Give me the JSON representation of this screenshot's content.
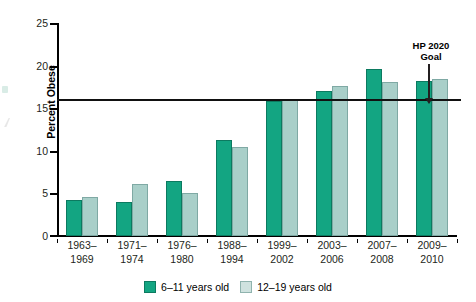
{
  "chart_data": {
    "type": "bar",
    "title": "",
    "xlabel": "",
    "ylabel": "Percent Obese",
    "ylim": [
      0,
      25
    ],
    "yticks": [
      0,
      5,
      10,
      15,
      20,
      25
    ],
    "grid": false,
    "legend_position": "bottom-center",
    "categories": [
      "1963–\n1969",
      "1971–\n1974",
      "1976–\n1980",
      "1988–\n1994",
      "1999–\n2002",
      "2003–\n2006",
      "2007–\n2008",
      "2009–\n2010"
    ],
    "category_lines": [
      [
        "1963–",
        "1969"
      ],
      [
        "1971–",
        "1974"
      ],
      [
        "1976–",
        "1980"
      ],
      [
        "1988–",
        "1994"
      ],
      [
        "1999–",
        "2002"
      ],
      [
        "2003–",
        "2006"
      ],
      [
        "2007–",
        "2008"
      ],
      [
        "2009–",
        "2010"
      ]
    ],
    "series": [
      {
        "name": "6–11 years old",
        "color": "#13a582",
        "values": [
          4.2,
          4.0,
          6.5,
          11.3,
          15.9,
          17.0,
          19.6,
          18.2
        ]
      },
      {
        "name": "12–19 years old",
        "color": "#a9cfc9",
        "values": [
          4.6,
          6.1,
          5.0,
          10.5,
          16.1,
          17.6,
          18.1,
          18.4
        ]
      }
    ],
    "annotations": [
      {
        "name": "hp-2020-goal",
        "text_lines": [
          "HP 2020",
          "Goal"
        ],
        "reference_line_value": 16.0,
        "reference_line_color": "#111111"
      }
    ]
  },
  "legend": {
    "items": [
      {
        "label": "6–11 years old"
      },
      {
        "label": "12–19 years old"
      }
    ]
  },
  "yticks": {
    "t0": "0",
    "t5": "5",
    "t10": "10",
    "t15": "15",
    "t20": "20",
    "t25": "25"
  },
  "annotation": {
    "line1": "HP 2020",
    "line2": "Goal"
  }
}
